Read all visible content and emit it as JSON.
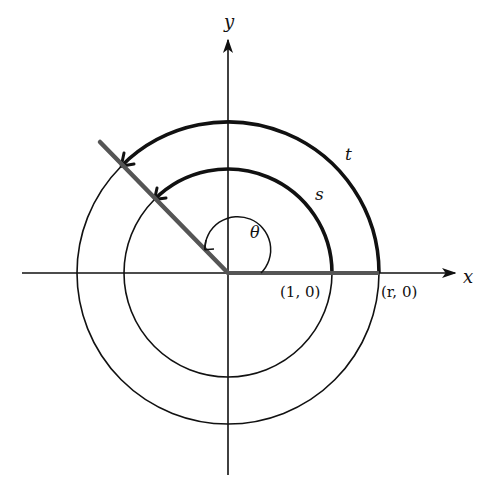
{
  "diagram": {
    "type": "polar-angle-circles",
    "axes": {
      "x_label": "x",
      "y_label": "y"
    },
    "circles": [
      {
        "name": "unit-circle",
        "radius_label": "1",
        "point_label": "(1, 0)",
        "arc_label": "s"
      },
      {
        "name": "radius-r-circle",
        "radius_label": "r",
        "point_label": "(r, 0)",
        "arc_label": "t"
      }
    ],
    "angle": {
      "label": "θ",
      "degrees_approx": 135
    },
    "colors": {
      "stroke": "#111111",
      "ray": "#555555",
      "background": "#ffffff"
    }
  }
}
